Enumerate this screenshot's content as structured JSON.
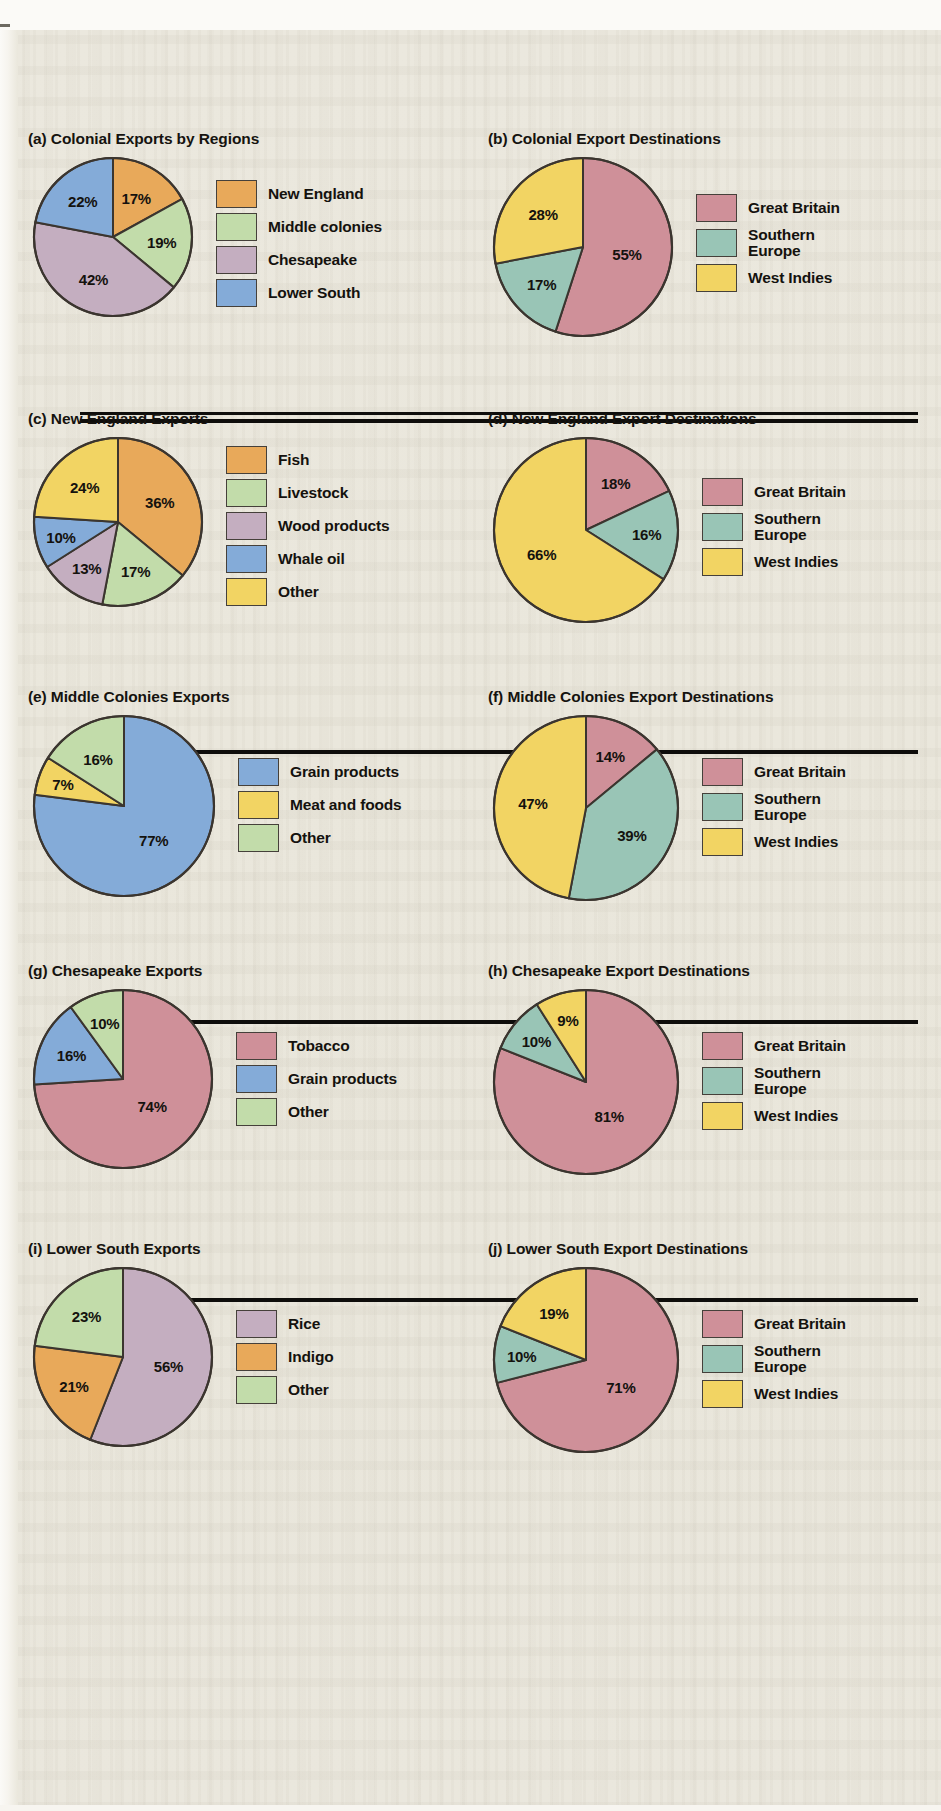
{
  "figure": {
    "background_color": "#eae7dc",
    "palette": {
      "orange": "#e8a95a",
      "green": "#c2dcaa",
      "mauve": "#c4aec0",
      "blue": "#84abd8",
      "yellow": "#f2d463",
      "rose": "#cf9099",
      "teal": "#99c5b6",
      "outline": "#3b352f"
    }
  },
  "chart_data": [
    {
      "id": "a",
      "type": "pie",
      "title": "(a) Colonial Exports by Regions",
      "categories": [
        "New England",
        "Middle colonies",
        "Chesapeake",
        "Lower South"
      ],
      "values": [
        17,
        19,
        42,
        22
      ],
      "value_labels": [
        "17%",
        "19%",
        "42%",
        "22%"
      ],
      "colors": [
        "#e8a95a",
        "#c2dcaa",
        "#c4aec0",
        "#84abd8"
      ],
      "legend_position": "right",
      "legend_labels": [
        "New England",
        "Middle colonies",
        "Chesapeake",
        "Lower South"
      ]
    },
    {
      "id": "b",
      "type": "pie",
      "title": "(b) Colonial Export Destinations",
      "categories": [
        "Great Britain",
        "Southern Europe",
        "West Indies"
      ],
      "values": [
        55,
        17,
        28
      ],
      "value_labels": [
        "55%",
        "17%",
        "28%"
      ],
      "colors": [
        "#cf9099",
        "#99c5b6",
        "#f2d463"
      ],
      "legend_position": "right",
      "legend_labels": [
        "Great Britain",
        "Southern\nEurope",
        "West Indies"
      ]
    },
    {
      "id": "c",
      "type": "pie",
      "title": "(c) New England Exports",
      "categories": [
        "Fish",
        "Livestock",
        "Wood products",
        "Whale oil",
        "Other"
      ],
      "values": [
        36,
        17,
        13,
        10,
        24
      ],
      "value_labels": [
        "36%",
        "17%",
        "13%",
        "10%",
        "24%"
      ],
      "colors": [
        "#e8a95a",
        "#c2dcaa",
        "#c4aec0",
        "#84abd8",
        "#f2d463"
      ],
      "legend_position": "right",
      "legend_labels": [
        "Fish",
        "Livestock",
        "Wood products",
        "Whale oil",
        "Other"
      ]
    },
    {
      "id": "d",
      "type": "pie",
      "title": "(d) New England Export Destinations",
      "categories": [
        "Great Britain",
        "Southern Europe",
        "West Indies"
      ],
      "values": [
        18,
        16,
        66
      ],
      "value_labels": [
        "18%",
        "16%",
        "66%"
      ],
      "colors": [
        "#cf9099",
        "#99c5b6",
        "#f2d463"
      ],
      "legend_position": "right",
      "legend_labels": [
        "Great Britain",
        "Southern\nEurope",
        "West Indies"
      ]
    },
    {
      "id": "e",
      "type": "pie",
      "title": "(e) Middle Colonies Exports",
      "categories": [
        "Grain products",
        "Meat and foods",
        "Other"
      ],
      "values": [
        77,
        7,
        16
      ],
      "value_labels": [
        "77%",
        "7%",
        "16%"
      ],
      "colors": [
        "#84abd8",
        "#f2d463",
        "#c2dcaa"
      ],
      "legend_position": "right",
      "legend_labels": [
        "Grain products",
        "Meat and foods",
        "Other"
      ]
    },
    {
      "id": "f",
      "type": "pie",
      "title": "(f) Middle Colonies Export Destinations",
      "categories": [
        "Great Britain",
        "Southern Europe",
        "West Indies"
      ],
      "values": [
        14,
        39,
        47
      ],
      "value_labels": [
        "14%",
        "39%",
        "47%"
      ],
      "colors": [
        "#cf9099",
        "#99c5b6",
        "#f2d463"
      ],
      "legend_position": "right",
      "legend_labels": [
        "Great Britain",
        "Southern\nEurope",
        "West Indies"
      ]
    },
    {
      "id": "g",
      "type": "pie",
      "title": "(g) Chesapeake Exports",
      "categories": [
        "Tobacco",
        "Grain products",
        "Other"
      ],
      "values": [
        74,
        16,
        10
      ],
      "value_labels": [
        "74%",
        "16%",
        "10%"
      ],
      "colors": [
        "#cf9099",
        "#84abd8",
        "#c2dcaa"
      ],
      "legend_position": "right",
      "legend_labels": [
        "Tobacco",
        "Grain products",
        "Other"
      ]
    },
    {
      "id": "h",
      "type": "pie",
      "title": "(h) Chesapeake Export Destinations",
      "categories": [
        "Great Britain",
        "Southern Europe",
        "West Indies"
      ],
      "values": [
        81,
        10,
        9
      ],
      "value_labels": [
        "81%",
        "10%",
        "9%"
      ],
      "colors": [
        "#cf9099",
        "#99c5b6",
        "#f2d463"
      ],
      "legend_position": "right",
      "legend_labels": [
        "Great Britain",
        "Southern\nEurope",
        "West Indies"
      ]
    },
    {
      "id": "i",
      "type": "pie",
      "title": "(i) Lower South Exports",
      "categories": [
        "Rice",
        "Indigo",
        "Other"
      ],
      "values": [
        56,
        21,
        23
      ],
      "value_labels": [
        "56%",
        "21%",
        "23%"
      ],
      "colors": [
        "#c4aec0",
        "#e8a95a",
        "#c2dcaa"
      ],
      "legend_position": "right",
      "legend_labels": [
        "Rice",
        "Indigo",
        "Other"
      ]
    },
    {
      "id": "j",
      "type": "pie",
      "title": "(j) Lower South Export Destinations",
      "categories": [
        "Great Britain",
        "Southern Europe",
        "West Indies"
      ],
      "values": [
        71,
        10,
        19
      ],
      "value_labels": [
        "71%",
        "10%",
        "19%"
      ],
      "colors": [
        "#cf9099",
        "#99c5b6",
        "#f2d463"
      ],
      "legend_position": "right",
      "legend_labels": [
        "Great Britain",
        "Southern\nEurope",
        "West Indies"
      ]
    }
  ]
}
